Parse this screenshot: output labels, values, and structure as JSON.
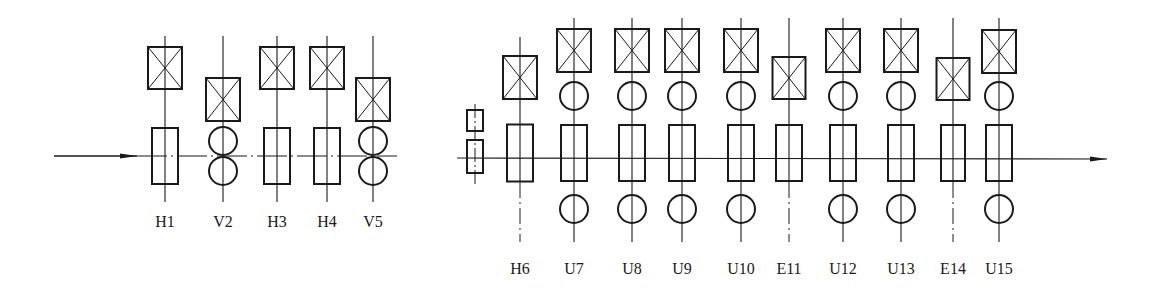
{
  "diagram": {
    "colors": {
      "line": "#1a1a1a",
      "background": "#ffffff"
    },
    "left_group": {
      "line_y": 156,
      "arrow": {
        "x1": 54,
        "x2": 137
      },
      "line_end_x": 397,
      "label_y": 227,
      "stands": [
        {
          "label": "H1",
          "type": "H",
          "x": 165,
          "motor_top": 47
        },
        {
          "label": "V2",
          "type": "V",
          "x": 223,
          "motor_top": 78
        },
        {
          "label": "H3",
          "type": "H",
          "x": 277,
          "motor_top": 47
        },
        {
          "label": "H4",
          "type": "H",
          "x": 327,
          "motor_top": 47
        },
        {
          "label": "V5",
          "type": "V",
          "x": 373,
          "motor_top": 78
        }
      ]
    },
    "right_group": {
      "line_y": 158,
      "line_start_x": 457,
      "arrow_tip_x": 1107,
      "label_y": 274,
      "edger_small": {
        "x": 475
      },
      "stands": [
        {
          "label": "H6",
          "type": "H6",
          "x": 520,
          "motor_top": 56
        },
        {
          "label": "U7",
          "type": "U",
          "x": 574,
          "motor_top": 29
        },
        {
          "label": "U8",
          "type": "U",
          "x": 632,
          "motor_top": 29
        },
        {
          "label": "U9",
          "type": "U",
          "x": 682,
          "motor_top": 29
        },
        {
          "label": "U10",
          "type": "U",
          "x": 741,
          "motor_top": 29
        },
        {
          "label": "E11",
          "type": "E",
          "x": 789,
          "motor_top": 57
        },
        {
          "label": "U12",
          "type": "U",
          "x": 843,
          "motor_top": 29
        },
        {
          "label": "U13",
          "type": "U",
          "x": 901,
          "motor_top": 29
        },
        {
          "label": "E14",
          "type": "E",
          "x": 953,
          "motor_top": 58
        },
        {
          "label": "U15",
          "type": "U",
          "x": 999,
          "motor_top": 30
        }
      ]
    }
  }
}
